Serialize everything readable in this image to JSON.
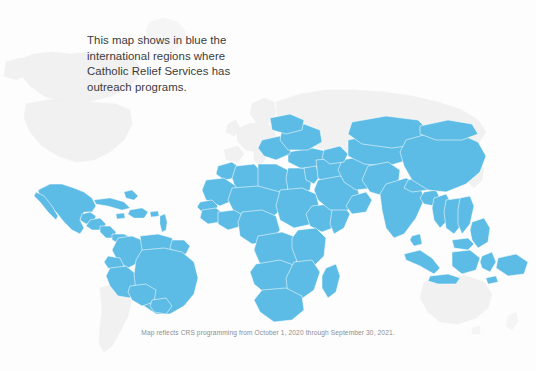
{
  "page": {
    "background_color": "#fdfdfd",
    "width": 536,
    "height": 371
  },
  "legend": {
    "description": "This map shows in blue the\ninternational regions where\nCatholic Relief Services has\noutreach programs.",
    "text_color": "#3b3b3b"
  },
  "footnote": {
    "text": "Map reflects CRS programming from October 1, 2020 through September 30, 2021.",
    "text_color": "#8d8d8d"
  },
  "map": {
    "title": "World map of Catholic Relief Services outreach regions",
    "active_color": "#5cbce5",
    "active_border_color": "#ffffff",
    "inactive_color": "#f1f1f1",
    "active_regions": [
      "Mexico",
      "Central America",
      "Caribbean",
      "Northern South America",
      "Brazil",
      "Bolivia",
      "Peru",
      "Colombia",
      "Venezuela",
      "Ecuador",
      "Africa",
      "Middle East",
      "Balkans",
      "Eastern Europe",
      "Central Asia",
      "South Asia",
      "China",
      "Southeast Asia",
      "Indonesia",
      "Philippines"
    ],
    "inactive_regions": [
      "United States",
      "Canada",
      "Greenland",
      "Western Europe",
      "Russia",
      "Argentina",
      "Chile",
      "Australia",
      "New Zealand",
      "Japan"
    ]
  }
}
